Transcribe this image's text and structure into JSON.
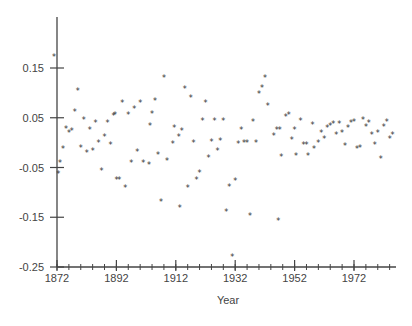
{
  "chart_data": {
    "type": "scatter",
    "title": "",
    "xlabel": "Year",
    "ylabel": "",
    "xlim": [
      1872,
      1986
    ],
    "ylim": [
      -0.25,
      0.2
    ],
    "x_ticks": [
      1872,
      1892,
      1912,
      1932,
      1952,
      1972
    ],
    "x_minor_step": 4,
    "y_ticks": [
      0.15,
      0.05,
      -0.05,
      -0.15,
      -0.25
    ],
    "y_tick_labels": [
      "0.15",
      "0.05",
      "-0.05",
      "-0.15",
      "-0.25"
    ],
    "x_tick_labels": [
      "1872",
      "1892",
      "1912",
      "1932",
      "1952",
      "1972"
    ],
    "grid": false,
    "legend": null,
    "marker": "*",
    "color": "#333333",
    "points": [
      [
        1871.0,
        0.172
      ],
      [
        1872.4,
        -0.062
      ],
      [
        1873.0,
        -0.04
      ],
      [
        1874.0,
        -0.012
      ],
      [
        1875.0,
        0.028
      ],
      [
        1876.0,
        0.02
      ],
      [
        1877.0,
        0.024
      ],
      [
        1878.0,
        0.062
      ],
      [
        1879.0,
        0.105
      ],
      [
        1880.0,
        -0.01
      ],
      [
        1881.0,
        0.046
      ],
      [
        1882.0,
        -0.02
      ],
      [
        1883.0,
        0.026
      ],
      [
        1884.0,
        -0.016
      ],
      [
        1885.0,
        0.04
      ],
      [
        1886.0,
        0.0
      ],
      [
        1887.0,
        -0.056
      ],
      [
        1888.0,
        0.012
      ],
      [
        1889.0,
        0.04
      ],
      [
        1890.0,
        -0.004
      ],
      [
        1891.0,
        0.054
      ],
      [
        1891.5,
        0.056
      ],
      [
        1892.0,
        -0.075
      ],
      [
        1893.0,
        -0.075
      ],
      [
        1894.0,
        0.08
      ],
      [
        1895.0,
        -0.09
      ],
      [
        1896.0,
        0.056
      ],
      [
        1897.0,
        -0.04
      ],
      [
        1898.0,
        0.068
      ],
      [
        1899.0,
        -0.018
      ],
      [
        1900.0,
        0.08
      ],
      [
        1901.0,
        -0.04
      ],
      [
        1903.0,
        -0.045
      ],
      [
        1903.3,
        0.034
      ],
      [
        1904.0,
        0.058
      ],
      [
        1905.0,
        0.085
      ],
      [
        1906.0,
        -0.024
      ],
      [
        1907.0,
        -0.118
      ],
      [
        1908.0,
        0.13
      ],
      [
        1909.0,
        -0.036
      ],
      [
        1911.0,
        -0.002
      ],
      [
        1911.5,
        0.03
      ],
      [
        1913.0,
        0.012
      ],
      [
        1913.3,
        -0.132
      ],
      [
        1914.0,
        0.024
      ],
      [
        1915.0,
        0.108
      ],
      [
        1916.0,
        -0.09
      ],
      [
        1917.0,
        0.09
      ],
      [
        1918.0,
        0.0
      ],
      [
        1919.0,
        -0.074
      ],
      [
        1920.0,
        -0.06
      ],
      [
        1921.0,
        0.044
      ],
      [
        1922.0,
        0.08
      ],
      [
        1923.0,
        -0.03
      ],
      [
        1924.0,
        0.002
      ],
      [
        1925.0,
        0.044
      ],
      [
        1926.0,
        -0.016
      ],
      [
        1927.0,
        0.004
      ],
      [
        1928.0,
        0.044
      ],
      [
        1929.0,
        -0.14
      ],
      [
        1930.0,
        -0.088
      ],
      [
        1931.0,
        -0.23
      ],
      [
        1932.0,
        -0.076
      ],
      [
        1933.0,
        -0.002
      ],
      [
        1934.0,
        0.026
      ],
      [
        1935.0,
        0.0
      ],
      [
        1936.0,
        0.0
      ],
      [
        1937.0,
        -0.148
      ],
      [
        1938.0,
        0.042
      ],
      [
        1939.0,
        0.0
      ],
      [
        1940.0,
        0.098
      ],
      [
        1941.0,
        0.11
      ],
      [
        1942.0,
        0.13
      ],
      [
        1943.0,
        0.074
      ],
      [
        1945.0,
        0.014
      ],
      [
        1946.0,
        0.026
      ],
      [
        1946.5,
        -0.158
      ],
      [
        1947.0,
        0.026
      ],
      [
        1947.5,
        -0.028
      ],
      [
        1949.0,
        0.052
      ],
      [
        1950.0,
        0.056
      ],
      [
        1951.0,
        0.006
      ],
      [
        1952.0,
        0.026
      ],
      [
        1952.5,
        -0.026
      ],
      [
        1954.0,
        0.044
      ],
      [
        1955.0,
        -0.004
      ],
      [
        1956.0,
        -0.004
      ],
      [
        1956.5,
        -0.026
      ],
      [
        1958.0,
        0.036
      ],
      [
        1958.5,
        -0.012
      ],
      [
        1960.0,
        0.0
      ],
      [
        1961.0,
        0.02
      ],
      [
        1962.0,
        0.008
      ],
      [
        1963.0,
        0.03
      ],
      [
        1964.0,
        0.034
      ],
      [
        1965.0,
        0.038
      ],
      [
        1966.0,
        0.016
      ],
      [
        1967.0,
        0.038
      ],
      [
        1968.0,
        0.02
      ],
      [
        1969.0,
        -0.006
      ],
      [
        1970.0,
        0.03
      ],
      [
        1971.0,
        0.04
      ],
      [
        1972.0,
        0.042
      ],
      [
        1973.0,
        -0.012
      ],
      [
        1974.0,
        -0.01
      ],
      [
        1975.0,
        0.046
      ],
      [
        1976.0,
        0.032
      ],
      [
        1977.0,
        0.04
      ],
      [
        1978.0,
        0.016
      ],
      [
        1979.0,
        -0.004
      ],
      [
        1980.0,
        0.02
      ],
      [
        1981.0,
        -0.032
      ],
      [
        1982.0,
        0.032
      ],
      [
        1983.0,
        0.042
      ],
      [
        1984.0,
        0.008
      ],
      [
        1985.0,
        0.016
      ]
    ]
  },
  "layout": {
    "x0_px": 57,
    "x_px_per_year": 2.97,
    "x_axis_end_px": 396,
    "y_axis_px": 267,
    "y_top_px": 17,
    "y_ref_value": 0.15,
    "y_ref_px": 68,
    "y_px_per_unit": 497.5
  }
}
